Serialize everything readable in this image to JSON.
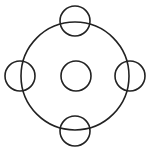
{
  "diagram": {
    "stroke_color": "#222222",
    "background": "#ffffff",
    "stroke_width": 1.6,
    "outer_circle": {
      "cx": 75,
      "cy": 76,
      "r": 54
    },
    "small_circles": [
      {
        "name": "center",
        "cx": 76,
        "cy": 76,
        "r": 15
      },
      {
        "name": "top",
        "cx": 75,
        "cy": 21,
        "r": 15
      },
      {
        "name": "bottom",
        "cx": 75,
        "cy": 131,
        "r": 15
      },
      {
        "name": "left",
        "cx": 20,
        "cy": 76,
        "r": 15
      },
      {
        "name": "right",
        "cx": 130,
        "cy": 76,
        "r": 15
      }
    ]
  }
}
